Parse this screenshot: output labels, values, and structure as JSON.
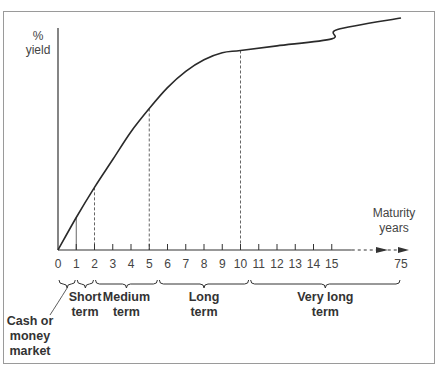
{
  "chart_data": {
    "type": "line",
    "title": "",
    "xlabel": [
      "Maturity",
      "years"
    ],
    "ylabel": [
      "%",
      "yield"
    ],
    "x_tick_labels": [
      "0",
      "1",
      "2",
      "3",
      "4",
      "5",
      "6",
      "7",
      "8",
      "9",
      "10",
      "11",
      "12",
      "13",
      "14",
      "15",
      "75"
    ],
    "x_ticks_linear": [
      0,
      1,
      2,
      3,
      4,
      5,
      6,
      7,
      8,
      9,
      10,
      11,
      12,
      13,
      14,
      15
    ],
    "x_break": {
      "from": 15,
      "to": 75,
      "style": "dashed-arrow"
    },
    "xlim": [
      0,
      75
    ],
    "y_ticks": [],
    "grid": false,
    "series": [
      {
        "name": "yield curve",
        "note": "relative yield (0 = origin, 100 = top of curve); no numeric y scale shown",
        "points": [
          {
            "x": 0,
            "y": 0
          },
          {
            "x": 1,
            "y": 14
          },
          {
            "x": 2,
            "y": 27
          },
          {
            "x": 3,
            "y": 39
          },
          {
            "x": 4,
            "y": 51
          },
          {
            "x": 5,
            "y": 61
          },
          {
            "x": 6,
            "y": 70
          },
          {
            "x": 7,
            "y": 77
          },
          {
            "x": 8,
            "y": 82
          },
          {
            "x": 9,
            "y": 85
          },
          {
            "x": 10,
            "y": 86
          },
          {
            "x": 12,
            "y": 88
          },
          {
            "x": 15,
            "y": 91
          },
          {
            "x": 20,
            "y": 95
          },
          {
            "x": 75,
            "y": 100
          }
        ]
      }
    ],
    "reference_lines": [
      {
        "x": 1,
        "style": "solid"
      },
      {
        "x": 2,
        "style": "dashed"
      },
      {
        "x": 5,
        "style": "dashed"
      },
      {
        "x": 10,
        "style": "dashed"
      }
    ],
    "term_braces": [
      {
        "from": 0,
        "to": 1,
        "label": [
          "Cash or",
          "money",
          "market"
        ]
      },
      {
        "from": 1,
        "to": 2,
        "label": [
          "Short",
          "term"
        ]
      },
      {
        "from": 2,
        "to": 5.5,
        "label": [
          "Medium",
          "term"
        ]
      },
      {
        "from": 5.5,
        "to": 10.5,
        "label": [
          "Long",
          "term"
        ]
      },
      {
        "from": 10.5,
        "to": 75,
        "label": [
          "Very long",
          "term"
        ]
      }
    ]
  },
  "colors": {
    "frame": "#9a9a9a",
    "axis": "#333333",
    "curve": "#2a2a2a",
    "guide": "#666666"
  }
}
